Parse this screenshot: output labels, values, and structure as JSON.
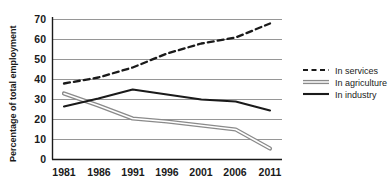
{
  "chart_data": {
    "type": "line",
    "title": "",
    "subtitle": "",
    "xlabel": "",
    "ylabel": "Percentage of total employment",
    "categories": [
      "1981",
      "1986",
      "1991",
      "1996",
      "2001",
      "2006",
      "2011"
    ],
    "x": [
      1981,
      1986,
      1991,
      1996,
      2001,
      2006,
      2011
    ],
    "xlim": [
      1981,
      2011
    ],
    "ylim": [
      0,
      70
    ],
    "y_ticks": [
      0,
      10,
      20,
      30,
      40,
      50,
      60,
      70
    ],
    "x_ticks": [
      "1981",
      "1986",
      "1991",
      "1996",
      "2001",
      "2006",
      "2011"
    ],
    "grid": "horizontal",
    "legend_position": "right",
    "series": [
      {
        "name": "In services",
        "style": "dashed",
        "color": "#1a1a1a",
        "values": [
          38,
          41,
          46,
          53,
          58,
          61,
          68
        ]
      },
      {
        "name": "In agriculture",
        "style": "double",
        "color": "#8a8a8a",
        "values": [
          33,
          27,
          20.5,
          19,
          17,
          15,
          5.5
        ]
      },
      {
        "name": "In industry",
        "style": "solid",
        "color": "#1a1a1a",
        "values": [
          26.5,
          30.5,
          35,
          32.5,
          30,
          29,
          24.5
        ]
      }
    ]
  },
  "axis": {
    "y_title": "Percentage of total employment",
    "y_tick_0": "0",
    "y_tick_10": "10",
    "y_tick_20": "20",
    "y_tick_30": "30",
    "y_tick_40": "40",
    "y_tick_50": "50",
    "y_tick_60": "60",
    "y_tick_70": "70",
    "x_tick_1": "1981",
    "x_tick_2": "1986",
    "x_tick_3": "1991",
    "x_tick_4": "1996",
    "x_tick_5": "2001",
    "x_tick_6": "2006",
    "x_tick_7": "2011"
  },
  "legend": {
    "item_services": "In services",
    "item_agriculture": "In agriculture",
    "item_industry": "In industry"
  },
  "colors": {
    "ink": "#1a1a1a",
    "grid": "#8a8a8a",
    "agriculture": "#8a8a8a",
    "background": "#ffffff"
  }
}
